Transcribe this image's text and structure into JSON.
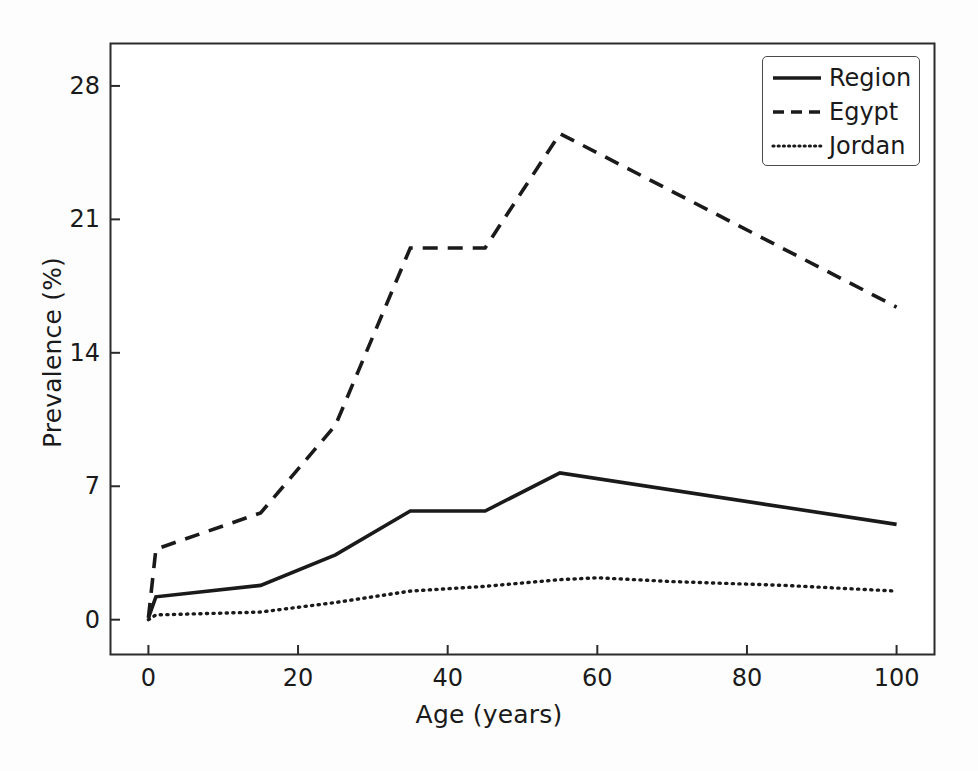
{
  "chart_data": {
    "type": "line",
    "title": "",
    "xlabel": "Age (years)",
    "ylabel": "Prevalence (%)",
    "xlim": [
      -5,
      105
    ],
    "ylim": [
      -1.8,
      30.2
    ],
    "xticks": [
      0,
      20,
      40,
      60,
      80,
      100
    ],
    "xticklabels": [
      "0",
      "20",
      "40",
      "60",
      "80",
      "100"
    ],
    "yticks": [
      0,
      7,
      14,
      21,
      28
    ],
    "yticklabels": [
      "0",
      "7",
      "14",
      "21",
      "28"
    ],
    "grid": false,
    "legend_position": "upper right",
    "series": [
      {
        "name": "Region",
        "linestyle": "solid",
        "color": "#1a1a1a",
        "x": [
          0,
          1,
          15,
          25,
          35,
          45,
          55,
          100
        ],
        "values": [
          0.1,
          1.2,
          1.8,
          3.4,
          5.7,
          5.7,
          7.7,
          5.0
        ]
      },
      {
        "name": "Egypt",
        "linestyle": "dashed",
        "color": "#1a1a1a",
        "x": [
          0,
          1,
          15,
          25,
          35,
          45,
          55,
          100
        ],
        "values": [
          0.1,
          3.7,
          5.6,
          10.2,
          19.5,
          19.5,
          25.5,
          16.4
        ]
      },
      {
        "name": "Jordan",
        "linestyle": "dotted",
        "color": "#1a1a1a",
        "x": [
          0,
          1,
          15,
          25,
          35,
          45,
          55,
          60,
          70,
          85,
          100
        ],
        "values": [
          0.0,
          0.25,
          0.4,
          0.9,
          1.5,
          1.75,
          2.1,
          2.2,
          2.0,
          1.8,
          1.5
        ]
      }
    ]
  },
  "legend": {
    "entries": [
      {
        "label": "Region",
        "style": "solid"
      },
      {
        "label": "Egypt",
        "style": "dashed"
      },
      {
        "label": "Jordan",
        "style": "dotted"
      }
    ]
  },
  "axes": {
    "frame_color": "#2b2b2b",
    "background": "#ffffff"
  }
}
